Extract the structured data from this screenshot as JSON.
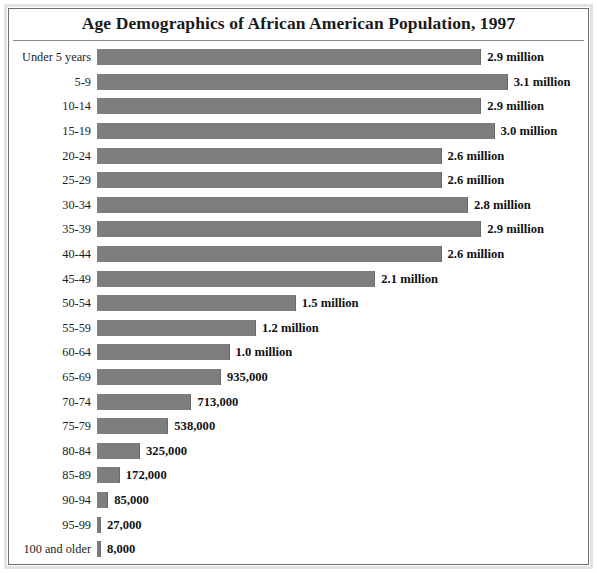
{
  "chart": {
    "title": "Age Demographics of African American Population, 1997"
  },
  "style": {
    "bar_color": "#7d7d7d",
    "text_color": "#1a1a1a",
    "background": "#ffffff",
    "border_color": "#6f6f6f"
  },
  "chart_data": {
    "type": "bar",
    "orientation": "horizontal",
    "title": "Age Demographics of African American Population, 1997",
    "xlabel": "",
    "ylabel": "",
    "grid": false,
    "legend": "none",
    "xlim": [
      0,
      3.1
    ],
    "units": "people",
    "categories": [
      "Under 5 years",
      "5-9",
      "10-14",
      "15-19",
      "20-24",
      "25-29",
      "30-34",
      "35-39",
      "40-44",
      "45-49",
      "50-54",
      "55-59",
      "60-64",
      "65-69",
      "70-74",
      "75-79",
      "80-84",
      "85-89",
      "90-94",
      "95-99",
      "100 and older"
    ],
    "values": [
      2900000,
      3100000,
      2900000,
      3000000,
      2600000,
      2600000,
      2800000,
      2900000,
      2600000,
      2100000,
      1500000,
      1200000,
      1000000,
      935000,
      713000,
      538000,
      325000,
      172000,
      85000,
      27000,
      8000
    ],
    "data_labels": [
      "2.9 million",
      "3.1 million",
      "2.9 million",
      "3.0 million",
      "2.6 million",
      "2.6 million",
      "2.8 million",
      "2.9 million",
      "2.6 million",
      "2.1 million",
      "1.5 million",
      "1.2 million",
      "1.0 million",
      "935,000",
      "713,000",
      "538,000",
      "325,000",
      "172,000",
      "85,000",
      "27,000",
      "8,000"
    ]
  }
}
